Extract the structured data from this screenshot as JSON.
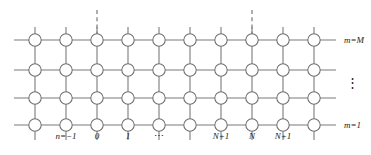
{
  "figure": {
    "name": "rectangular-grid-lattice-diagram",
    "colors": {
      "line": "#7a7a7a",
      "node_stroke": "#6e6e6e",
      "node_fill": "#ffffff",
      "text": "#1a1a1a",
      "background": "#ffffff"
    },
    "geometry": {
      "columns": 10,
      "rows": 4,
      "column_x": [
        35,
        66,
        97,
        128,
        159,
        190,
        221,
        252,
        283,
        314
      ],
      "row_y": [
        40,
        70,
        98,
        125
      ],
      "node_radius": 6.2,
      "line_left_end": 14,
      "line_right_end": 336,
      "stub_top_y": 27,
      "stub_bottom_y": 140
    },
    "dashed_lines": [
      {
        "name": "dashed-line-left",
        "x": 97,
        "y_top": 10,
        "y_bottom": 34
      },
      {
        "name": "dashed-line-right",
        "x": 252,
        "y_top": 10,
        "y_bottom": 34
      }
    ],
    "column_labels": [
      {
        "text": "n=−1",
        "x": 66
      },
      {
        "text": "0",
        "x": 97
      },
      {
        "text": "1",
        "x": 128
      },
      {
        "text": "⋯",
        "x": 159,
        "is_ellipsis": true
      },
      {
        "text": "N+1",
        "x": 221
      },
      {
        "text": "N",
        "x": 252
      },
      {
        "text": "N+1",
        "x": 283
      }
    ],
    "row_labels": [
      {
        "text": "m=M",
        "y": 40
      },
      {
        "text": "m=1",
        "y": 125
      }
    ],
    "vertical_ellipsis": "⋮"
  }
}
